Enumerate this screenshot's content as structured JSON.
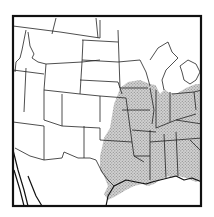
{
  "map": {
    "type": "range map",
    "region": "Contiguous United States (west to east, north to Gulf coast)",
    "title": "",
    "legend": [],
    "colors": {
      "background": "#ffffff",
      "border": "#111111",
      "state_lines": "#222222",
      "range_fill": "#b8b8b8",
      "range_stipple": "#888888"
    },
    "shaded_range": {
      "description": "Stippled distribution area covering the central and eastern US from the Great Plains eastward to the Atlantic edge of the frame and south to the Gulf Coast",
      "approx_states": [
        "Minnesota (south)",
        "Wisconsin (south)",
        "Michigan (south)",
        "Iowa",
        "Illinois",
        "Indiana",
        "Ohio",
        "Nebraska (east)",
        "Kansas (east)",
        "Missouri",
        "Kentucky",
        "Tennessee",
        "Oklahoma",
        "Texas (east/central)",
        "Arkansas",
        "Louisiana",
        "Mississippi",
        "Alabama",
        "Georgia",
        "West Virginia",
        "Virginia",
        "North Carolina",
        "South Carolina"
      ]
    }
  }
}
